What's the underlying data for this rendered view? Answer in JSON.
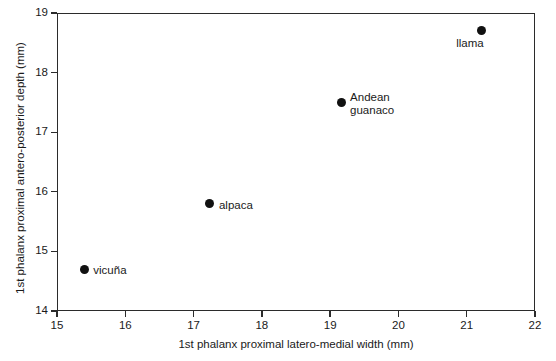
{
  "chart_data": {
    "type": "scatter",
    "title": "",
    "xlabel": "1st phalanx proximal latero-medial width (mm)",
    "ylabel": "1st phalanx proximal antero-posterior depth (mm)",
    "xlim": [
      15,
      22
    ],
    "ylim": [
      14,
      19
    ],
    "xticks": [
      15,
      16,
      17,
      18,
      19,
      20,
      21,
      22
    ],
    "yticks": [
      14,
      15,
      16,
      17,
      18,
      19
    ],
    "grid": false,
    "legend": "none",
    "marker_color": "#111111",
    "axis_color": "#2b2b2b",
    "background": "#ffffff",
    "points": [
      {
        "label": "vicuña",
        "x": 15.4,
        "y": 14.7,
        "label_pos": "right"
      },
      {
        "label": "alpaca",
        "x": 17.24,
        "y": 15.8,
        "label_pos": "right"
      },
      {
        "label": "Andean\nguanaco",
        "x": 19.16,
        "y": 17.5,
        "label_pos": "right"
      },
      {
        "label": "llama",
        "x": 21.22,
        "y": 18.7,
        "label_pos": "below-left"
      }
    ]
  }
}
